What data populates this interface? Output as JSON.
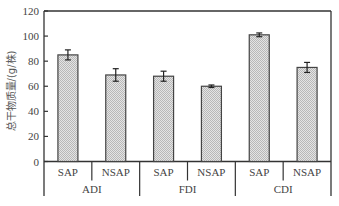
{
  "chart_data": {
    "type": "bar",
    "title": "",
    "xlabel": "",
    "ylabel": "总干物质量/(g/株)",
    "ylim": [
      0,
      120
    ],
    "yticks": [
      0,
      20,
      40,
      60,
      80,
      100,
      120
    ],
    "grid": false,
    "legend": null,
    "groups": [
      "ADI",
      "FDI",
      "CDI"
    ],
    "subcategories": [
      "SAP",
      "NSAP"
    ],
    "categories": [
      "ADI-SAP",
      "ADI-NSAP",
      "FDI-SAP",
      "FDI-NSAP",
      "CDI-SAP",
      "CDI-NSAP"
    ],
    "values": [
      85,
      69,
      68,
      60,
      101,
      75
    ],
    "errors": [
      4,
      5,
      4,
      1,
      1.5,
      4
    ]
  },
  "colors": {
    "bar_fill": "#cfcfcf",
    "bar_stroke": "#444444",
    "axis": "#333333"
  }
}
